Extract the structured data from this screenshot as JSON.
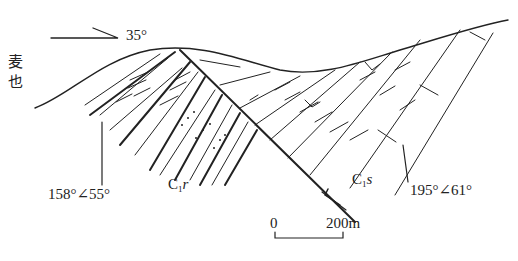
{
  "diagram": {
    "type": "geological-cross-section",
    "direction_label": "35°",
    "place_name_line1": "麦",
    "place_name_line2": "也",
    "left_attitude": "158°∠55°",
    "right_attitude": "195°∠61°",
    "unit_left": {
      "main": "C",
      "sub": "1",
      "suffix": "r"
    },
    "unit_right": {
      "main": "C",
      "sub": "1",
      "suffix": "s"
    },
    "scale_bar": {
      "start": "0",
      "end": "200m"
    },
    "colors": {
      "line": "#222222",
      "background": "#ffffff"
    }
  }
}
